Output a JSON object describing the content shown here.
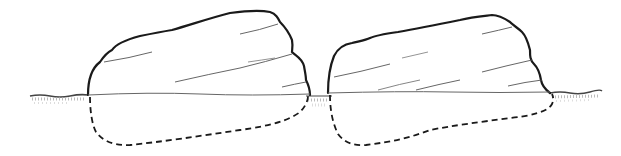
{
  "illustration": {
    "description": "Two boulders partially embedded in the ground; dashed lines show the buried portions",
    "colors": {
      "background": "#ffffff",
      "outline": "#1a1a1a",
      "detail": "#555555",
      "ground": "#888888"
    },
    "ground_level_y": 95,
    "boulders": [
      {
        "name": "left-boulder",
        "visible_top_y": 10,
        "x_range": [
          88,
          310
        ],
        "buried_bottom_y": 146
      },
      {
        "name": "right-boulder",
        "visible_top_y": 15,
        "x_range": [
          328,
          550
        ],
        "buried_bottom_y": 145
      }
    ]
  }
}
